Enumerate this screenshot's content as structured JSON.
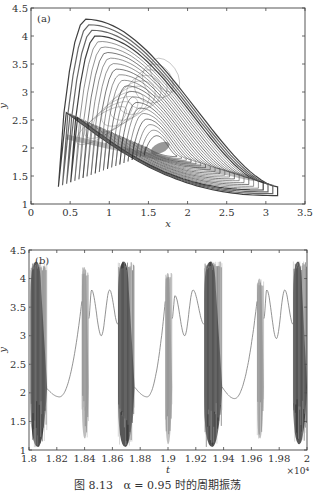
{
  "caption": {
    "figure_label": "图 8.13",
    "text": "α = 0.95 时的周期振荡"
  },
  "chart_data": [
    {
      "type": "line",
      "panel_label": "(a)",
      "title": "",
      "xlabel": "x",
      "ylabel": "y",
      "xlim": [
        0,
        3.5
      ],
      "ylim": [
        1,
        4.5
      ],
      "xticks": [
        "0",
        "0.5",
        "1",
        "1.5",
        "2",
        "2.5",
        "3",
        "3.5"
      ],
      "yticks": [
        "1",
        "1.5",
        "2",
        "2.5",
        "3",
        "3.5",
        "4",
        "4.5"
      ],
      "grid": false,
      "description": "Phase portrait: nested loops spiralling around focus near (1.65, 2.0); outer loop spans x≈0.35–3.15, y≈1.15–4.3",
      "series": [
        {
          "name": "phase trajectory",
          "outer_loop": {
            "x_min": 0.35,
            "x_max": 3.15,
            "y_min": 1.15,
            "y_max": 4.3,
            "peak_x": 0.7
          },
          "focus": {
            "x": 1.65,
            "y": 2.0
          },
          "loop_count": 22
        }
      ]
    },
    {
      "type": "line",
      "panel_label": "(b)",
      "title": "",
      "xlabel": "t",
      "ylabel": "y",
      "x_multiplier": "×10⁴",
      "xlim": [
        1.8,
        2.0
      ],
      "ylim": [
        1,
        4.5
      ],
      "xticks": [
        "1.8",
        "1.82",
        "1.84",
        "1.86",
        "1.88",
        "1.9",
        "1.92",
        "1.94",
        "1.96",
        "1.98",
        "2"
      ],
      "yticks": [
        "1",
        "1.5",
        "2",
        "2.5",
        "3",
        "3.5",
        "4",
        "4.5"
      ],
      "grid": false,
      "description": "Time series with bursts of fast oscillation alternating with slow smooth segments",
      "series": [
        {
          "name": "y(t)",
          "bursts": [
            {
              "t_start": 1.801,
              "t_end": 1.813,
              "y_min": 1.05,
              "y_max": 4.3,
              "shade": "dark"
            },
            {
              "t_start": 1.838,
              "t_end": 1.843,
              "y_min": 1.2,
              "y_max": 4.2,
              "shade": "light"
            },
            {
              "t_start": 1.864,
              "t_end": 1.876,
              "y_min": 1.05,
              "y_max": 4.3,
              "shade": "dark"
            },
            {
              "t_start": 1.898,
              "t_end": 1.903,
              "y_min": 1.1,
              "y_max": 4.1,
              "shade": "light"
            },
            {
              "t_start": 1.926,
              "t_end": 1.939,
              "y_min": 1.05,
              "y_max": 4.3,
              "shade": "dark"
            },
            {
              "t_start": 1.964,
              "t_end": 1.969,
              "y_min": 1.2,
              "y_max": 4.0,
              "shade": "light"
            },
            {
              "t_start": 1.99,
              "t_end": 2.0,
              "y_min": 1.1,
              "y_max": 4.3,
              "shade": "dark"
            }
          ],
          "slow_segments": [
            {
              "type": "trough",
              "t": [
                1.812,
                1.838
              ],
              "y_min": 1.93,
              "t_min": 1.822
            },
            {
              "type": "double_hump",
              "t": [
                1.843,
                1.864
              ],
              "peaks": [
                [
                  1.845,
                  3.8
                ],
                [
                  1.858,
                  3.8
                ]
              ],
              "valley": [
                1.852,
                3.0
              ]
            },
            {
              "type": "trough",
              "t": [
                1.876,
                1.898
              ],
              "y_min": 1.93,
              "t_min": 1.885
            },
            {
              "type": "double_hump",
              "t": [
                1.903,
                1.926
              ],
              "peaks": [
                [
                  1.905,
                  3.7
                ],
                [
                  1.918,
                  3.8
                ]
              ],
              "valley": [
                1.912,
                3.0
              ]
            },
            {
              "type": "trough",
              "t": [
                1.939,
                1.964
              ],
              "y_min": 1.9,
              "t_min": 1.948
            },
            {
              "type": "double_hump",
              "t": [
                1.969,
                1.99
              ],
              "peaks": [
                [
                  1.971,
                  3.8
                ],
                [
                  1.984,
                  3.8
                ]
              ],
              "valley": [
                1.978,
                2.95
              ]
            }
          ]
        }
      ]
    }
  ]
}
